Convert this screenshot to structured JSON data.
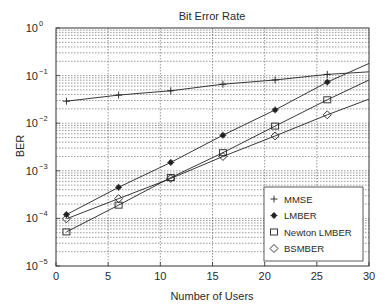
{
  "chart_data": {
    "type": "line",
    "title": "Bit Error Rate",
    "xlabel": "Number of Users",
    "ylabel": "BER",
    "xlim": [
      0,
      30
    ],
    "ylim": [
      1e-05,
      1
    ],
    "yscale": "log",
    "grid": true,
    "x_ticks": [
      0,
      5,
      10,
      15,
      20,
      25,
      30
    ],
    "x_tick_labels": [
      "0",
      "5",
      "10",
      "15",
      "20",
      "25",
      "30"
    ],
    "y_tick_exponents": [
      0,
      -1,
      -2,
      -3,
      -4,
      -5
    ],
    "y_tick_labels": [
      "10^0",
      "10^-1",
      "10^-2",
      "10^-3",
      "10^-4",
      "10^-5"
    ],
    "legend_position": "lower right",
    "x": [
      1,
      6,
      11,
      16,
      21,
      26
    ],
    "series": [
      {
        "name": "MMSE",
        "marker": "plus",
        "values": [
          0.029,
          0.039,
          0.048,
          0.066,
          0.081,
          0.106
        ],
        "end_value_at_30": 0.12
      },
      {
        "name": "LMBER",
        "marker": "star",
        "values": [
          0.00012,
          0.00045,
          0.0015,
          0.0056,
          0.019,
          0.073
        ],
        "end_value_at_30": 0.18
      },
      {
        "name": "Newton LMBER",
        "marker": "square",
        "values": [
          5.2e-05,
          0.00019,
          0.00072,
          0.0024,
          0.0087,
          0.031
        ],
        "end_value_at_30": 0.081
      },
      {
        "name": "BSMBER",
        "marker": "diamond",
        "values": [
          9.8e-05,
          0.00026,
          0.00069,
          0.002,
          0.0054,
          0.015
        ],
        "end_value_at_30": 0.032
      }
    ]
  }
}
